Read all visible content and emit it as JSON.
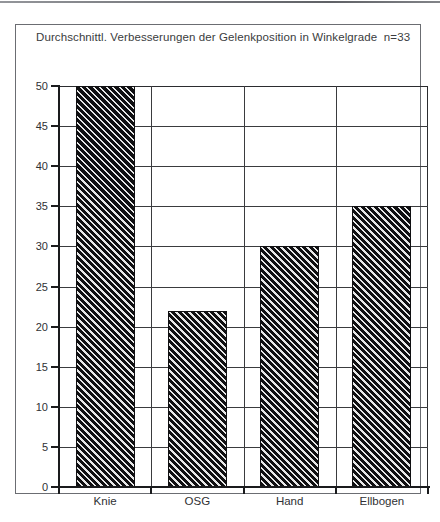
{
  "chart_data": {
    "type": "bar",
    "title": "Durchschnittl. Verbesserungen der Gelenkposition in Winkelgrade  n=33",
    "categories": [
      "Knie",
      "OSG",
      "Hand",
      "Ellbogen"
    ],
    "values": [
      50,
      22,
      30,
      35
    ],
    "xlabel": "",
    "ylabel": "",
    "ylim": [
      0,
      50
    ],
    "ytick_step": 5,
    "yticks": [
      0,
      5,
      10,
      15,
      20,
      25,
      30,
      35,
      40,
      45,
      50
    ],
    "ytick_labels": [
      "0",
      "5",
      "10",
      "15",
      "20",
      "25",
      "30",
      "35",
      "40",
      "45",
      "50"
    ],
    "grid": true,
    "grid_axis": "both",
    "legend": false,
    "legend_position": "none",
    "bar_fill": "diagonal-hatch",
    "bar_color": "#121214",
    "sample_size_note": "n=33"
  },
  "figure": {
    "frame_border_color": "#6b6d72",
    "axis_color": "#1a1b1d",
    "grid_color": "#3a3b3e",
    "background": "#ffffff",
    "title_color": "#3a3c40"
  }
}
